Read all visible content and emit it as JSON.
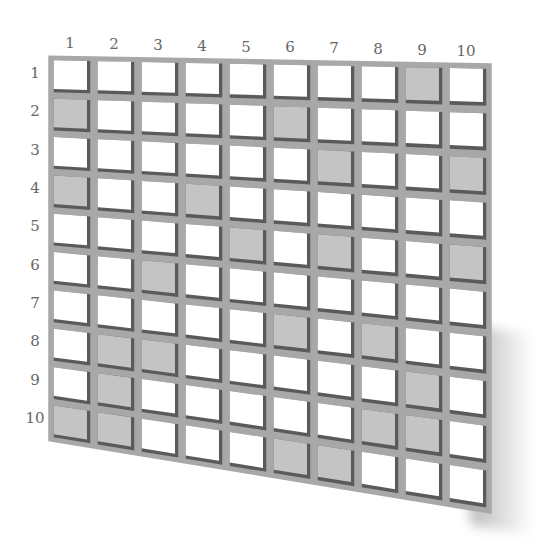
{
  "grid": {
    "rows": 10,
    "cols": 10,
    "column_labels": [
      "1",
      "2",
      "3",
      "4",
      "5",
      "6",
      "7",
      "8",
      "9",
      "10"
    ],
    "row_labels": [
      "1",
      "2",
      "3",
      "4",
      "5",
      "6",
      "7",
      "8",
      "9",
      "10"
    ],
    "shaded_cells": [
      {
        "row": 1,
        "col": 9
      },
      {
        "row": 2,
        "col": 1
      },
      {
        "row": 2,
        "col": 6
      },
      {
        "row": 3,
        "col": 7
      },
      {
        "row": 3,
        "col": 10
      },
      {
        "row": 4,
        "col": 1
      },
      {
        "row": 4,
        "col": 4
      },
      {
        "row": 5,
        "col": 5
      },
      {
        "row": 5,
        "col": 7
      },
      {
        "row": 5,
        "col": 10
      },
      {
        "row": 6,
        "col": 3
      },
      {
        "row": 7,
        "col": 6
      },
      {
        "row": 7,
        "col": 8
      },
      {
        "row": 8,
        "col": 2
      },
      {
        "row": 8,
        "col": 3
      },
      {
        "row": 8,
        "col": 9
      },
      {
        "row": 9,
        "col": 2
      },
      {
        "row": 9,
        "col": 8
      },
      {
        "row": 9,
        "col": 9
      },
      {
        "row": 10,
        "col": 1
      },
      {
        "row": 10,
        "col": 2
      },
      {
        "row": 10,
        "col": 6
      },
      {
        "row": 10,
        "col": 7
      }
    ]
  },
  "colors": {
    "frame": "#a8a8a8",
    "cell_empty": "#ffffff",
    "cell_shaded": "#c4c4c4",
    "cell_edge_shadow": "#5a5a5a",
    "label": "#666666"
  }
}
